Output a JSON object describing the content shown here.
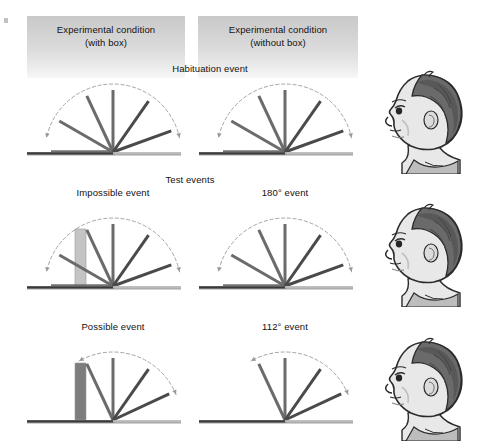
{
  "figure": {
    "title_columns": [
      {
        "line1": "Experimental condition",
        "line2": "(with box)"
      },
      {
        "line1": "Experimental condition",
        "line2": "(without box)"
      }
    ],
    "section_labels": {
      "habituation": "Habituation event",
      "test": "Test events"
    },
    "panel_labels": {
      "impossible": "Impossible event",
      "event_180": "180° event",
      "possible": "Possible event",
      "event_112": "112° event"
    },
    "colors": {
      "panel_gradient_top": "#c9c9c9",
      "panel_gradient_bottom": "#f7f7f7",
      "screen_flap": "#6b6b6b",
      "screen_flap_dark": "#4a4a4a",
      "baseline": "#3a3a3a",
      "baseline_light": "#b9b9b9",
      "arc_dashed": "#9a9a9a",
      "box_light": "#c4c4c4",
      "box_dark": "#7d7d7d",
      "text": "#111111",
      "baby_hair": "#6a6a6a",
      "baby_skin": "#e8e8e8",
      "baby_outline": "#2b2b2b"
    },
    "rows": [
      {
        "name": "habituation",
        "left": {
          "name": "habituation-with-box",
          "box": null,
          "flap_angles_deg": [
            180,
            150,
            115,
            90,
            55,
            20
          ],
          "arc_sweep_deg": [
            12,
            168
          ]
        },
        "right": {
          "name": "habituation-without-box",
          "box": null,
          "flap_angles_deg": [
            180,
            150,
            115,
            90,
            55,
            20
          ],
          "arc_sweep_deg": [
            12,
            168
          ]
        }
      },
      {
        "name": "test-impossible",
        "left": {
          "name": "impossible-event",
          "box": {
            "fill": "#c4c4c4",
            "height_px": 57,
            "x_offset_px": -38
          },
          "flap_angles_deg": [
            180,
            150,
            115,
            90,
            55,
            20
          ],
          "arc_sweep_deg": [
            12,
            168
          ]
        },
        "right": {
          "name": "180-degree-event",
          "box": null,
          "flap_angles_deg": [
            180,
            150,
            115,
            90,
            55,
            20
          ],
          "arc_sweep_deg": [
            12,
            168
          ]
        }
      },
      {
        "name": "test-possible",
        "left": {
          "name": "possible-event",
          "box": {
            "fill": "#7d7d7d",
            "height_px": 57,
            "x_offset_px": -38
          },
          "flap_angles_deg": [
            115,
            90,
            55,
            25
          ],
          "arc_sweep_deg": [
            22,
            120
          ]
        },
        "right": {
          "name": "112-degree-event",
          "box": null,
          "flap_angles_deg": [
            115,
            90,
            55,
            25
          ],
          "arc_sweep_deg": [
            22,
            120
          ]
        }
      }
    ],
    "babies": [
      {
        "name": "infant-head-habituation"
      },
      {
        "name": "infant-head-impossible"
      },
      {
        "name": "infant-head-possible"
      }
    ]
  }
}
